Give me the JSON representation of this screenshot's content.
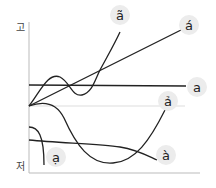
{
  "axes": {
    "high_label": "고",
    "low_label": "저"
  },
  "tones": [
    {
      "name": "ngang",
      "label": "a"
    },
    {
      "name": "sac",
      "label": "á"
    },
    {
      "name": "nga",
      "label": "ã"
    },
    {
      "name": "hoi",
      "label": "ả"
    },
    {
      "name": "huyen",
      "label": "à"
    },
    {
      "name": "nang",
      "label": "ạ"
    }
  ],
  "colors": {
    "line": "#222222",
    "axis": "#bbbbbb",
    "guide": "#dddddd",
    "bubble": "#ececec"
  }
}
